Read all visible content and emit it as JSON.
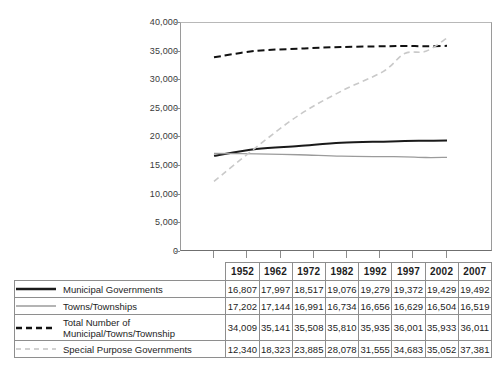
{
  "chart_data": {
    "type": "line",
    "title": "",
    "subtitle": "",
    "xlabel": "",
    "ylabel": "",
    "grid": false,
    "legend_position": "table-below",
    "categories": [
      "1952",
      "1962",
      "1972",
      "1982",
      "1992",
      "1997",
      "2002",
      "2007"
    ],
    "x": [
      1952,
      1962,
      1972,
      1982,
      1992,
      1997,
      2002,
      2007
    ],
    "ylim": [
      0,
      40000
    ],
    "ytick_labels": [
      "40,000",
      "35,000",
      "30,000",
      "25,000",
      "20,000",
      "15,000",
      "10,000",
      "5,000",
      "0"
    ],
    "ytick_values": [
      40000,
      35000,
      30000,
      25000,
      20000,
      15000,
      10000,
      5000,
      0
    ],
    "series": [
      {
        "name": "Municipal Governments",
        "style": "solid",
        "color": "#1a1a1a",
        "width": 2,
        "values": [
          16807,
          17997,
          18517,
          19076,
          19279,
          19372,
          19429,
          19492
        ],
        "display": [
          "16,807",
          "17,997",
          "18,517",
          "19,076",
          "19,279",
          "19,372",
          "19,429",
          "19,492"
        ]
      },
      {
        "name": "Towns/Townships",
        "style": "solid",
        "color": "#9b9b9b",
        "width": 1.3,
        "values": [
          17202,
          17144,
          16991,
          16734,
          16656,
          16629,
          16504,
          16519
        ],
        "display": [
          "17,202",
          "17,144",
          "16,991",
          "16,734",
          "16,656",
          "16,629",
          "16,504",
          "16,519"
        ]
      },
      {
        "name": "Total Number of\nMunicipal/Towns/Township",
        "style": "dashed",
        "color": "#111111",
        "width": 2,
        "values": [
          34009,
          35141,
          35508,
          35810,
          35935,
          36001,
          35933,
          36011
        ],
        "display": [
          "34,009",
          "35,141",
          "35,508",
          "35,810",
          "35,935",
          "36,001",
          "35,933",
          "36,011"
        ]
      },
      {
        "name": "Special Purpose Governments",
        "style": "dashed",
        "color": "#c9c9c9",
        "width": 1.6,
        "values": [
          12340,
          18323,
          23885,
          28078,
          31555,
          34683,
          35052,
          37381
        ],
        "display": [
          "12,340",
          "18,323",
          "23,885",
          "28,078",
          "31,555",
          "34,683",
          "35,052",
          "37,381"
        ]
      }
    ]
  },
  "table": {
    "header_blank": "",
    "years": [
      "1952",
      "1962",
      "1972",
      "1982",
      "1992",
      "1997",
      "2002",
      "2007"
    ],
    "rows": [
      {
        "legend": "Municipal Governments",
        "values": [
          "16,807",
          "17,997",
          "18,517",
          "19,076",
          "19,279",
          "19,372",
          "19,429",
          "19,492"
        ]
      },
      {
        "legend": "Towns/Townships",
        "values": [
          "17,202",
          "17,144",
          "16,991",
          "16,734",
          "16,656",
          "16,629",
          "16,504",
          "16,519"
        ]
      },
      {
        "legend": "Total Number of\nMunicipal/Towns/Township",
        "values": [
          "34,009",
          "35,141",
          "35,508",
          "35,810",
          "35,935",
          "36,001",
          "35,933",
          "36,011"
        ]
      },
      {
        "legend": "Special Purpose Governments",
        "values": [
          "12,340",
          "18,323",
          "23,885",
          "28,078",
          "31,555",
          "34,683",
          "35,052",
          "37,381"
        ]
      }
    ]
  },
  "axis": {
    "y_labels": [
      "40,000",
      "35,000",
      "30,000",
      "25,000",
      "20,000",
      "15,000",
      "10,000",
      "5,000",
      "0"
    ]
  }
}
